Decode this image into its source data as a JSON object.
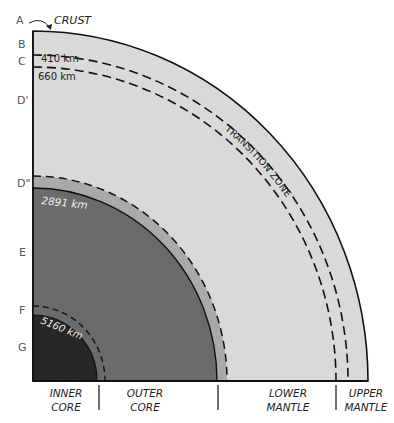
{
  "letters": [
    "A",
    "B",
    "C",
    "D'",
    "D\"",
    "E",
    "F",
    "G"
  ],
  "crust_label": "CRUST",
  "depths": {
    "d410": "410 km",
    "d660": "660 km",
    "d2891": "2891 km",
    "d5160": "5160 km"
  },
  "transition_zone_label": "TRANSITION ZONE",
  "bottom": {
    "inner_core": [
      "INNER",
      "CORE"
    ],
    "outer_core": [
      "OUTER",
      "CORE"
    ],
    "lower_mantle": [
      "LOWER",
      "MANTLE"
    ],
    "upper_mantle": [
      "UPPER",
      "MANTLE"
    ]
  },
  "colors": {
    "mantle": "#d9d9d9",
    "d_double_prime": "#a9a9a9",
    "outer_core": "#6b6b6b",
    "inner_core": "#272727"
  }
}
